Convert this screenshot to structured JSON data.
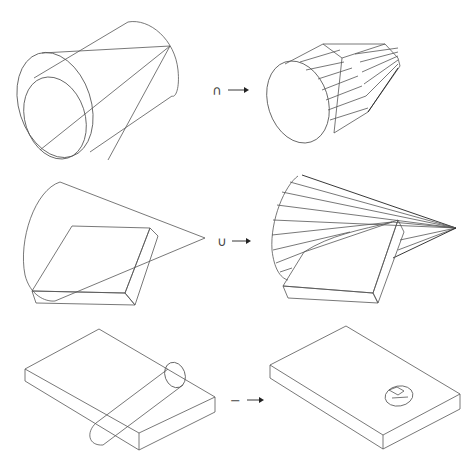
{
  "diagram": {
    "rows": [
      {
        "operation": "intersection",
        "operator_symbol": "∩",
        "input_description": "Truncated cone overlapping a cylinder (wireframe)",
        "result_description": "Faceted solid: cylinder front tapering into cone"
      },
      {
        "operation": "union",
        "operator_symbol": "∪",
        "input_description": "Cone and rectangular slab overlapping (wireframe)",
        "result_description": "Ruled cone surface joined with slab"
      },
      {
        "operation": "difference",
        "operator_symbol": "−",
        "input_description": "Rectangular slab with a cylinder passing through it",
        "result_description": "Slab with an elliptical hole cut through"
      }
    ],
    "colors": {
      "line": "#555555",
      "background": "#ffffff"
    }
  }
}
